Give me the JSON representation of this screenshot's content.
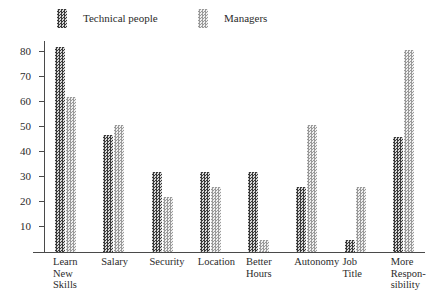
{
  "chart": {
    "type": "bar",
    "title": "",
    "xlabel": "",
    "ylabel": ""
  },
  "legend": {
    "position": "top",
    "entries": [
      {
        "label": "Technical people",
        "swatch": "dark-hatch-swatch",
        "color": "#3a3a3a"
      },
      {
        "label": "Managers",
        "swatch": "light-hatch-swatch",
        "color": "#9a9a9a"
      }
    ]
  },
  "yaxis": {
    "min": 0,
    "max": 85,
    "ticks": [
      10,
      20,
      30,
      40,
      50,
      60,
      70,
      80
    ],
    "tick_labels": [
      "10",
      "20",
      "30",
      "40",
      "50",
      "60",
      "70",
      "80"
    ]
  },
  "xaxis": {
    "categories": [
      "Learn\nNew\nSkills",
      "Salary",
      "Security",
      "Location",
      "Better\nHours",
      "Autonomy",
      "Job\nTitle",
      "More\nRespon-\nsibility"
    ]
  },
  "chart_data": {
    "type": "bar",
    "title": "",
    "xlabel": "",
    "ylabel": "",
    "ylim": [
      0,
      85
    ],
    "grid": false,
    "legend_position": "top",
    "categories": [
      "Learn New Skills",
      "Salary",
      "Security",
      "Location",
      "Better Hours",
      "Autonomy",
      "Job Title",
      "More Responsibility"
    ],
    "series": [
      {
        "name": "Technical people",
        "color": "#3a3a3a",
        "values": [
          82,
          47,
          32,
          32,
          32,
          26,
          5,
          46
        ]
      },
      {
        "name": "Managers",
        "color": "#9a9a9a",
        "values": [
          62,
          51,
          22,
          26,
          5,
          51,
          26,
          81
        ]
      }
    ]
  }
}
